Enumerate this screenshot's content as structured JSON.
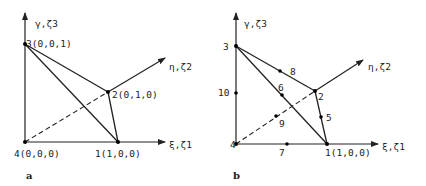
{
  "figure": {
    "panel_a": {
      "caption": "a",
      "axes": {
        "vertical": "γ,ζ3",
        "depth": "η,ζ2",
        "horizontal": "ξ,ζ1"
      },
      "vertices": [
        {
          "id": "1",
          "label": "1(1,0,0)"
        },
        {
          "id": "2",
          "label": "2(0,1,0)"
        },
        {
          "id": "3",
          "label": "3(0,0,1)"
        },
        {
          "id": "4",
          "label": "4(0,0,0)"
        }
      ]
    },
    "panel_b": {
      "caption": "b",
      "axes": {
        "vertical": "γ,ζ3",
        "depth": "η,ζ2",
        "horizontal": "ξ,ζ1"
      },
      "nodes": [
        {
          "id": "1",
          "label": "1(1,0,0)"
        },
        {
          "id": "2",
          "label": "2"
        },
        {
          "id": "3",
          "label": "3"
        },
        {
          "id": "4",
          "label": "4"
        },
        {
          "id": "5",
          "label": "5"
        },
        {
          "id": "6",
          "label": "6"
        },
        {
          "id": "7",
          "label": "7"
        },
        {
          "id": "8",
          "label": "8"
        },
        {
          "id": "9",
          "label": "9"
        },
        {
          "id": "10",
          "label": "10"
        }
      ]
    }
  }
}
